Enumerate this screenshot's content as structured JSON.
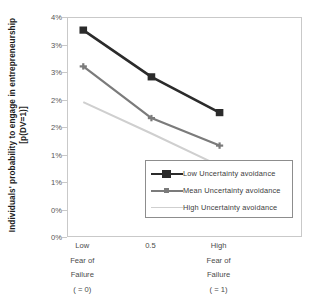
{
  "chart_data": {
    "type": "line",
    "title": "",
    "xlabel": "Fear of Failure",
    "ylabel": "Individuals' probability to engage in entrepreneurship [p(DV=1)]",
    "x": [
      0,
      0.5,
      1
    ],
    "categories": [
      "Low",
      "0.5",
      "High"
    ],
    "xtick_labels": [
      {
        "line1": "Low",
        "line2": "Fear of",
        "line3": "Failure",
        "line4": "( = 0)"
      },
      {
        "line1": "0.5",
        "line2": "",
        "line3": "",
        "line4": ""
      },
      {
        "line1": "High",
        "line2": "Fear of",
        "line3": "Failure",
        "line4": "( = 1)"
      }
    ],
    "ytick_labels": [
      "4%",
      "3%",
      "3%",
      "2%",
      "2%",
      "1%",
      "1%",
      "0%"
    ],
    "ytick_values": [
      4.0,
      3.5,
      3.0,
      2.5,
      2.0,
      1.5,
      1.0,
      0.5,
      0.0
    ],
    "ylim": [
      0,
      4
    ],
    "yunit": "%",
    "grid": false,
    "legend_position": "inside-bottom-right",
    "series": [
      {
        "name": "Low Uncertainty avoidance",
        "values": [
          3.78,
          2.93,
          2.28
        ],
        "color": "#2b2b2b",
        "marker": "square",
        "line_width": 2.6
      },
      {
        "name": "Mean Uncertainty avoidance",
        "values": [
          3.12,
          2.18,
          1.68
        ],
        "color": "#7b7b7b",
        "marker": "plus",
        "line_width": 2.2
      },
      {
        "name": "High Uncertainty avoidance",
        "values": [
          2.47,
          1.9,
          1.31
        ],
        "color": "#cfcfcf",
        "marker": "none",
        "line_width": 2.0
      }
    ]
  },
  "legend": {
    "items": [
      {
        "label": "Low Uncertainty avoidance"
      },
      {
        "label": "Mean Uncertainty avoidance"
      },
      {
        "label": "High Uncertainty avoidance"
      }
    ]
  },
  "colors": {
    "series_low": "#2b2b2b",
    "series_mean": "#7b7b7b",
    "series_high": "#cfcfcf",
    "frame": "#c9c9c9",
    "legend_border": "#8d8d8d",
    "text": "#3d3d3d",
    "background": "#ffffff"
  }
}
